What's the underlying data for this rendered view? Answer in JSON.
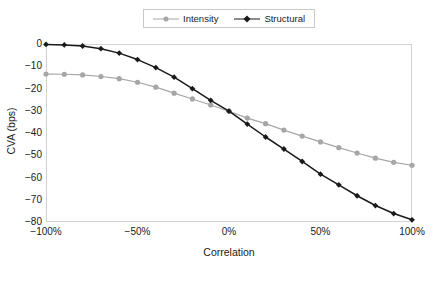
{
  "chart_data": {
    "type": "line",
    "title": "",
    "subtitle": "",
    "xlabel": "Correlation",
    "ylabel": "CVA (bps)",
    "xlim": [
      -100,
      100
    ],
    "ylim": [
      -80,
      0
    ],
    "grid": false,
    "legend_position": "top-center",
    "x": [
      -100,
      -90,
      -80,
      -70,
      -60,
      -50,
      -40,
      -30,
      -20,
      -10,
      0,
      10,
      20,
      30,
      40,
      50,
      60,
      70,
      80,
      90,
      100
    ],
    "x_tick_labels": [
      "-100%",
      "-50%",
      "0%",
      "50%",
      "100%"
    ],
    "x_tick_values": [
      -100,
      -50,
      0,
      50,
      100
    ],
    "y_tick_labels": [
      "0",
      "-10",
      "-20",
      "-30",
      "-40",
      "-50",
      "-60",
      "-70",
      "-80"
    ],
    "y_tick_values": [
      0,
      -10,
      -20,
      -30,
      -40,
      -50,
      -60,
      -70,
      -80
    ],
    "series": [
      {
        "name": "Intensity",
        "color": "#a6a6a6",
        "marker": "circle",
        "values": [
          -13.5,
          -13.6,
          -13.9,
          -14.6,
          -15.6,
          -17.2,
          -19.4,
          -22.1,
          -24.7,
          -27.4,
          -30.2,
          -33.3,
          -35.8,
          -38.7,
          -41.4,
          -44.0,
          -46.6,
          -49.0,
          -51.3,
          -53.2,
          -54.5
        ]
      },
      {
        "name": "Structural",
        "color": "#1a1a1a",
        "marker": "diamond",
        "values": [
          -0.2,
          -0.4,
          -0.9,
          -2.1,
          -4.1,
          -7.0,
          -10.6,
          -14.9,
          -20.1,
          -25.3,
          -30.2,
          -36.0,
          -41.8,
          -47.2,
          -52.8,
          -58.5,
          -63.3,
          -68.2,
          -72.6,
          -76.2,
          -79.0
        ]
      }
    ]
  },
  "legend": {
    "entries": [
      {
        "label": "Intensity",
        "color": "#a6a6a6",
        "marker": "circle"
      },
      {
        "label": "Structural",
        "color": "#1a1a1a",
        "marker": "diamond"
      }
    ]
  },
  "axes": {
    "x_title": "Correlation",
    "y_title": "CVA (bps)"
  },
  "caption": {
    "number": "",
    "text": ""
  }
}
